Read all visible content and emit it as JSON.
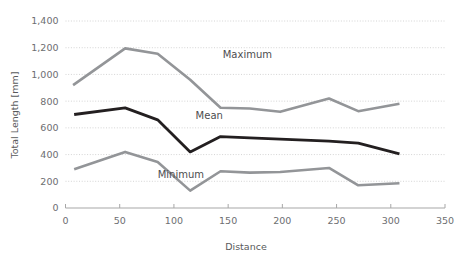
{
  "chart_data": {
    "type": "line",
    "title": "",
    "xlabel": "Distance",
    "ylabel": "Total Length [mm]",
    "xlim": [
      0,
      350
    ],
    "ylim": [
      0,
      1400
    ],
    "grid": true,
    "legend_position": "inline-labels",
    "x_ticks": [
      "0",
      "50",
      "100",
      "150",
      "200",
      "250",
      "300",
      "350"
    ],
    "x_tick_values": [
      0,
      50,
      100,
      150,
      200,
      250,
      300,
      350
    ],
    "y_ticks": [
      "0",
      "200",
      "400",
      "600",
      "800",
      "1,000",
      "1,200",
      "1,400"
    ],
    "y_tick_values": [
      0,
      200,
      400,
      600,
      800,
      1000,
      1200,
      1400
    ],
    "series": [
      {
        "name": "Maximum",
        "color": "#939598",
        "width": 2.6,
        "label_x": 145,
        "label_y": 1120,
        "x": [
          7,
          55,
          85,
          115,
          143,
          170,
          198,
          243,
          270,
          308
        ],
        "values": [
          920,
          1195,
          1155,
          960,
          750,
          745,
          720,
          820,
          725,
          780
        ]
      },
      {
        "name": "Mean",
        "color": "#231f20",
        "width": 2.8,
        "label_x": 120,
        "label_y": 670,
        "x": [
          8,
          55,
          85,
          115,
          143,
          170,
          198,
          243,
          270,
          308
        ],
        "values": [
          700,
          750,
          660,
          420,
          535,
          525,
          515,
          500,
          485,
          405
        ]
      },
      {
        "name": "Minimum",
        "color": "#939598",
        "width": 2.6,
        "label_x": 85,
        "label_y": 225,
        "x": [
          8,
          55,
          85,
          115,
          143,
          170,
          198,
          243,
          270,
          308
        ],
        "values": [
          290,
          420,
          345,
          130,
          275,
          265,
          270,
          300,
          170,
          185
        ]
      }
    ]
  },
  "axes": {
    "x_title": "Distance",
    "y_title": "Total Length [mm]"
  }
}
